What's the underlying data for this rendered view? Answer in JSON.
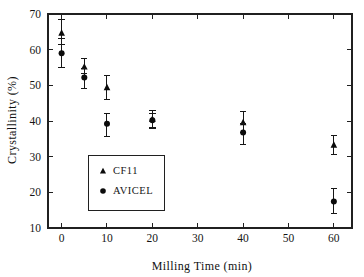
{
  "chart_data": {
    "type": "scatter",
    "title": "",
    "xlabel": "Milling Time (min)",
    "ylabel": "Crystallinity (%)",
    "xlim": [
      -3,
      64
    ],
    "ylim": [
      10,
      70
    ],
    "xticks": [
      0,
      10,
      20,
      30,
      40,
      50,
      60
    ],
    "xtick_labels": [
      "0",
      "10",
      "20",
      "30",
      "40",
      "50",
      "60"
    ],
    "yticks": [
      10,
      20,
      30,
      40,
      50,
      60,
      70
    ],
    "ytick_labels": [
      "10",
      "20",
      "30",
      "40",
      "50",
      "60",
      "70"
    ],
    "grid": false,
    "legend_position": "inside-lower-left",
    "series": [
      {
        "name": "CF11",
        "marker": "triangle",
        "color": "#0b0b0b",
        "x": [
          0,
          5,
          10,
          20,
          40,
          60
        ],
        "values": [
          64.7,
          55.2,
          49.4,
          40.5,
          39.6,
          33.3
        ],
        "yerr_upper": [
          3.8,
          2.2,
          3.4,
          2.4,
          3.0,
          2.6
        ],
        "yerr_lower": [
          3.3,
          2.0,
          3.3,
          2.4,
          2.8,
          2.8
        ]
      },
      {
        "name": "AVICEL",
        "marker": "circle",
        "color": "#0b0b0b",
        "x": [
          0,
          5,
          10,
          20,
          40,
          60
        ],
        "values": [
          59.0,
          52.2,
          39.2,
          40.2,
          36.8,
          17.4
        ],
        "yerr_upper": [
          4.0,
          2.6,
          2.8,
          2.0,
          2.6,
          3.6
        ],
        "yerr_lower": [
          3.9,
          3.2,
          3.5,
          2.2,
          3.3,
          3.4
        ]
      }
    ],
    "legend_entries": [
      {
        "label": "CF11",
        "marker": "triangle"
      },
      {
        "label": "AVICEL",
        "marker": "circle"
      }
    ]
  }
}
